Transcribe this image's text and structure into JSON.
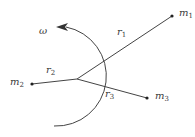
{
  "diagram": {
    "title": "",
    "colors": {
      "line": "#444444",
      "background": "#ffffff"
    },
    "labels": {
      "omega": "ω",
      "m1": {
        "base": "m",
        "sub": "1"
      },
      "m2": {
        "base": "m",
        "sub": "2"
      },
      "m3": {
        "base": "m",
        "sub": "3"
      },
      "r1": {
        "base": "r",
        "sub": "1"
      },
      "r2": {
        "base": "r",
        "sub": "2"
      },
      "r3": {
        "base": "r",
        "sub": "3"
      }
    },
    "nodes": [
      {
        "id": "center",
        "x": 77,
        "y": 79
      },
      {
        "id": "m1",
        "x": 172,
        "y": 16
      },
      {
        "id": "m2",
        "x": 32,
        "y": 84
      },
      {
        "id": "m3",
        "x": 147,
        "y": 98
      }
    ],
    "edges": [
      {
        "from": "center",
        "to": "m1",
        "label": "r1"
      },
      {
        "from": "center",
        "to": "m2",
        "label": "r2"
      },
      {
        "from": "center",
        "to": "m3",
        "label": "r3"
      }
    ],
    "rotation_arrow": {
      "label": "ω",
      "direction": "counterclockwise"
    }
  }
}
